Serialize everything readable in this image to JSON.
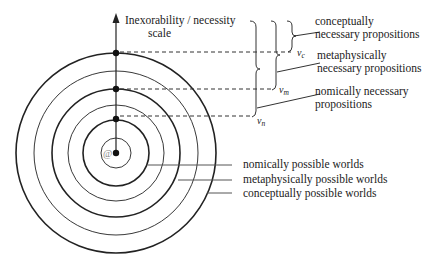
{
  "axis": {
    "label_line1": "Inexorability / necessity",
    "label_line2": "scale"
  },
  "center": {
    "symbol": "@"
  },
  "thresholds": [
    {
      "id": "vc",
      "symbol": "v",
      "subscript": "c"
    },
    {
      "id": "vm",
      "symbol": "v",
      "subscript": "m"
    },
    {
      "id": "vn",
      "symbol": "v",
      "subscript": "n"
    }
  ],
  "propositions": [
    {
      "line1": "conceptually",
      "line2": "necessary propositions"
    },
    {
      "line1": "metaphysically",
      "line2": "necessary propositions"
    },
    {
      "line1": "nomically necessary",
      "line2": "propositions"
    }
  ],
  "worlds": [
    {
      "label": "nomically possible worlds"
    },
    {
      "label": "metaphysically possible worlds"
    },
    {
      "label": "conceptually possible worlds"
    }
  ],
  "colors": {
    "ink": "#222222",
    "background": "#ffffff"
  }
}
